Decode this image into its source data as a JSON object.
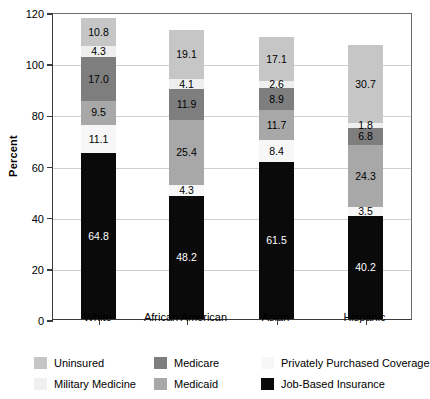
{
  "chart_data": {
    "type": "bar",
    "subtype": "stacked-bar",
    "title": "",
    "xlabel": "",
    "ylabel": "Percent",
    "ylim": [
      0,
      120
    ],
    "yticks": [
      0,
      20,
      40,
      60,
      80,
      100,
      120
    ],
    "grid": true,
    "legend_position": "bottom",
    "categories": [
      "White",
      "African American",
      "Asian",
      "Hispanic"
    ],
    "series": [
      {
        "name": "Job-Based Insurance",
        "color": "#0a0a0a",
        "label_color": "#ffffff",
        "values": [
          64.8,
          48.2,
          61.5,
          40.2
        ]
      },
      {
        "name": "Privately Purchased Coverage",
        "color": "#f7f7f7",
        "label_color": "#000000",
        "values": [
          11.1,
          4.3,
          8.4,
          3.5
        ]
      },
      {
        "name": "Medicaid",
        "color": "#a8a8a8",
        "label_color": "#000000",
        "values": [
          9.5,
          25.4,
          11.7,
          24.3
        ]
      },
      {
        "name": "Medicare",
        "color": "#7e7e7e",
        "label_color": "#000000",
        "values": [
          17.0,
          11.9,
          8.9,
          6.8
        ]
      },
      {
        "name": "Military Medicine",
        "color": "#efefef",
        "label_color": "#000000",
        "values": [
          4.3,
          4.1,
          2.6,
          1.8
        ]
      },
      {
        "name": "Uninsured",
        "color": "#c6c6c6",
        "label_color": "#000000",
        "values": [
          10.8,
          19.1,
          17.1,
          30.7
        ]
      }
    ],
    "totals": [
      117.5,
      113.0,
      110.2,
      107.3
    ]
  },
  "axis": {
    "y_title": "Percent",
    "y_tick_labels": [
      "0",
      "20",
      "40",
      "60",
      "80",
      "100",
      "120"
    ],
    "x_tick_labels": [
      "White",
      "African American",
      "Asian",
      "Hispanic"
    ]
  },
  "legend": {
    "entries": [
      {
        "label": "Uninsured",
        "color": "#c6c6c6"
      },
      {
        "label": "Medicare",
        "color": "#7e7e7e"
      },
      {
        "label": "Privately Purchased Coverage",
        "color": "#f7f7f7"
      },
      {
        "label": "Military Medicine",
        "color": "#efefef"
      },
      {
        "label": "Medicaid",
        "color": "#a8a8a8"
      },
      {
        "label": "Job-Based Insurance",
        "color": "#0a0a0a"
      }
    ]
  }
}
